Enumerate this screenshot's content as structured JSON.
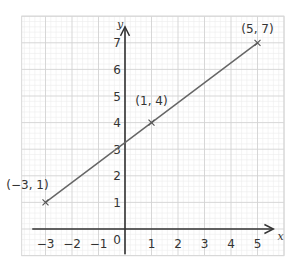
{
  "chart_data": {
    "type": "line",
    "title": "",
    "xlabel": "x",
    "ylabel": "y",
    "xlim": [
      -3.9,
      6.0
    ],
    "ylim": [
      -1.0,
      8.0
    ],
    "grid": true,
    "x_ticks": [
      -3,
      -2,
      -1,
      0,
      1,
      2,
      3,
      4,
      5
    ],
    "y_ticks": [
      1,
      2,
      3,
      4,
      5,
      6,
      7
    ],
    "x_tick_labels": [
      "−3",
      "−2",
      "−1",
      "0",
      "1",
      "2",
      "3",
      "4",
      "5"
    ],
    "y_tick_labels": [
      "1",
      "2",
      "3",
      "4",
      "5",
      "6",
      "7"
    ],
    "series": [
      {
        "name": "line",
        "x": [
          -3,
          1,
          5
        ],
        "y": [
          1,
          4,
          7
        ],
        "color": "#666666"
      }
    ],
    "annotations": [
      {
        "x": -3,
        "y": 1,
        "text": "(−3, 1)"
      },
      {
        "x": 1,
        "y": 4,
        "text": "(1, 4)"
      },
      {
        "x": 5,
        "y": 7,
        "text": "(5, 7)"
      }
    ]
  },
  "colors": {
    "minor_grid": "#ececec",
    "major_grid": "#d2d2d2",
    "axis": "#333333",
    "line": "#666666"
  }
}
